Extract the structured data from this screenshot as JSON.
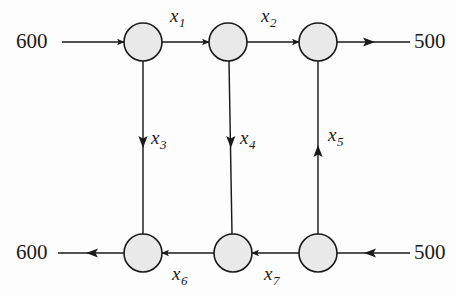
{
  "figure": {
    "type": "network-flow-diagram",
    "background_color": "#fdfdfd",
    "node_fill_color": "#e9e9e9",
    "node_stroke_color": "#1a1a1a",
    "edge_color": "#1a1a1a"
  },
  "supply_labels": {
    "top_left": "600",
    "top_right": "500",
    "bottom_left": "600",
    "bottom_right": "500"
  },
  "variables": {
    "x1": {
      "base": "x",
      "sub": "1"
    },
    "x2": {
      "base": "x",
      "sub": "2"
    },
    "x3": {
      "base": "x",
      "sub": "3"
    },
    "x4": {
      "base": "x",
      "sub": "4"
    },
    "x5": {
      "base": "x",
      "sub": "5"
    },
    "x6": {
      "base": "x",
      "sub": "6"
    },
    "x7": {
      "base": "x",
      "sub": "7"
    }
  },
  "nodes": [
    {
      "id": "n1",
      "cx": 143,
      "cy": 42,
      "r": 19
    },
    {
      "id": "n2",
      "cx": 228,
      "cy": 42,
      "r": 19
    },
    {
      "id": "n3",
      "cx": 318,
      "cy": 42,
      "r": 19
    },
    {
      "id": "n4",
      "cx": 143,
      "cy": 253,
      "r": 19
    },
    {
      "id": "n5",
      "cx": 233,
      "cy": 253,
      "r": 19
    },
    {
      "id": "n6",
      "cx": 318,
      "cy": 253,
      "r": 19
    }
  ],
  "edges": [
    {
      "id": "supply-in-top-left",
      "label": null,
      "direction": "right",
      "from": "600",
      "to": "n1"
    },
    {
      "id": "edge-x1",
      "label": "x1",
      "direction": "right",
      "from": "n1",
      "to": "n2"
    },
    {
      "id": "edge-x2",
      "label": "x2",
      "direction": "right",
      "from": "n2",
      "to": "n3"
    },
    {
      "id": "demand-out-top-right",
      "label": null,
      "direction": "right",
      "from": "n3",
      "to": "500"
    },
    {
      "id": "edge-x3",
      "label": "x3",
      "direction": "down",
      "from": "n1",
      "to": "n4"
    },
    {
      "id": "edge-x4",
      "label": "x4",
      "direction": "down",
      "from": "n2",
      "to": "n5"
    },
    {
      "id": "edge-x5",
      "label": "x5",
      "direction": "up",
      "from": "n6",
      "to": "n3"
    },
    {
      "id": "demand-out-bot-left",
      "label": null,
      "direction": "left",
      "from": "n4",
      "to": "600"
    },
    {
      "id": "edge-x6",
      "label": "x6",
      "direction": "left",
      "from": "n5",
      "to": "n4"
    },
    {
      "id": "edge-x7",
      "label": "x7",
      "direction": "left",
      "from": "n6",
      "to": "n5"
    },
    {
      "id": "supply-in-bot-right",
      "label": null,
      "direction": "left",
      "from": "500",
      "to": "n6"
    }
  ]
}
